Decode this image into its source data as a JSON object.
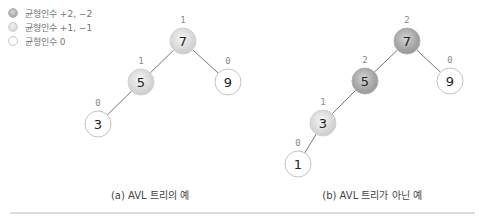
{
  "legend": [
    {
      "label": "균형인수 +2, −2",
      "kind": "heavy"
    },
    {
      "label": "균형인수 +1, −1",
      "kind": "light"
    },
    {
      "label": "균형인수 0",
      "kind": "none"
    }
  ],
  "trees": [
    {
      "caption": "(a) AVL 트리의 예",
      "nodes": [
        {
          "id": "a7",
          "value": "7",
          "balance": "1",
          "kind": "light"
        },
        {
          "id": "a5",
          "value": "5",
          "balance": "1",
          "kind": "light"
        },
        {
          "id": "a9",
          "value": "9",
          "balance": "0",
          "kind": "none"
        },
        {
          "id": "a3",
          "value": "3",
          "balance": "0",
          "kind": "none"
        }
      ],
      "edges": [
        [
          "a7",
          "a5"
        ],
        [
          "a7",
          "a9"
        ],
        [
          "a5",
          "a3"
        ]
      ]
    },
    {
      "caption": "(b) AVL 트리가 아닌 예",
      "nodes": [
        {
          "id": "b7",
          "value": "7",
          "balance": "2",
          "kind": "heavy"
        },
        {
          "id": "b5",
          "value": "5",
          "balance": "2",
          "kind": "heavy"
        },
        {
          "id": "b9",
          "value": "9",
          "balance": "0",
          "kind": "none"
        },
        {
          "id": "b3",
          "value": "3",
          "balance": "1",
          "kind": "light"
        },
        {
          "id": "b1",
          "value": "1",
          "balance": "0",
          "kind": "none"
        }
      ],
      "edges": [
        [
          "b7",
          "b5"
        ],
        [
          "b7",
          "b9"
        ],
        [
          "b5",
          "b3"
        ],
        [
          "b3",
          "b1"
        ]
      ]
    }
  ]
}
